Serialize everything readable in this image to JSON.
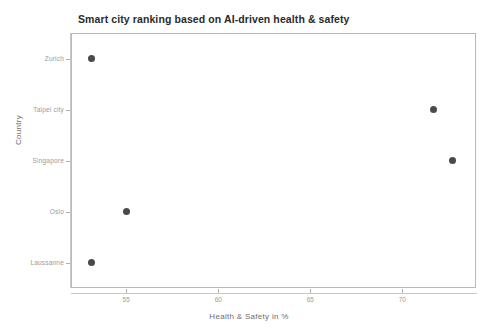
{
  "chart_data": {
    "type": "scatter",
    "title": "Smart city ranking based on AI-driven health & safety",
    "xlabel": "Health & Safety in %",
    "ylabel": "Country",
    "categories": [
      "Zurich",
      "Taipei city",
      "Singapore",
      "Oslo",
      "Laussanne"
    ],
    "points": [
      {
        "category": "Zurich",
        "value": 53.1
      },
      {
        "category": "Taipei city",
        "value": 71.7
      },
      {
        "category": "Singapore",
        "value": 72.7
      },
      {
        "category": "Oslo",
        "value": 55.0
      },
      {
        "category": "Laussanne",
        "value": 53.1
      }
    ],
    "xticks": [
      "55",
      "60",
      "65",
      "70"
    ],
    "xtick_values": [
      55,
      60,
      65,
      70
    ],
    "xlim": [
      52.0,
      74.0
    ],
    "grid": false,
    "legend": false,
    "marker_color": "#4a4a4e",
    "frame_color": "#b9b9b9",
    "background_color": "#ffffff"
  }
}
